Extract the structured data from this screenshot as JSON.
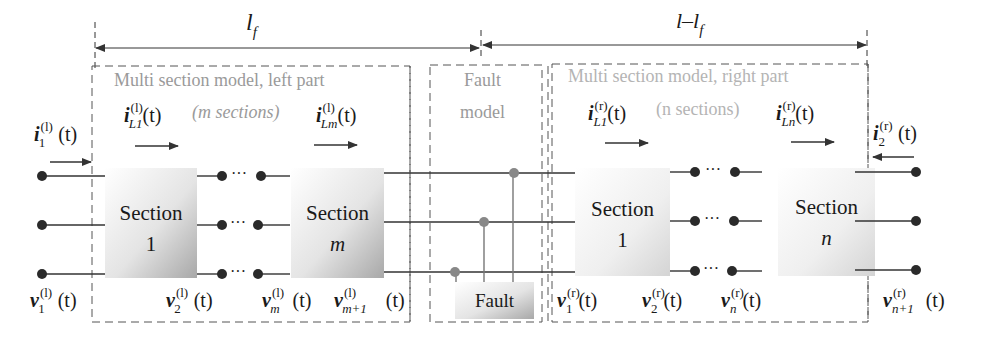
{
  "dimensions": {
    "left_label": "l",
    "left_label_sub": "f",
    "right_label": "l–l",
    "right_label_sub": "f"
  },
  "left_part": {
    "title": "Multi section model, left part",
    "count_label": "(m sections)",
    "sections": [
      {
        "label": "Section",
        "index": "1"
      },
      {
        "label": "Section",
        "index": "m"
      }
    ],
    "currents": [
      {
        "name": "i",
        "sup": "(l)",
        "sub": "1",
        "arg": "(t)"
      },
      {
        "name": "i",
        "sup": "(l)",
        "sub": "L1",
        "arg": "(t)"
      },
      {
        "name": "i",
        "sup": "(l)",
        "sub": "Lm",
        "arg": "(t)"
      }
    ],
    "voltages": [
      {
        "name": "v",
        "sup": "(l)",
        "sub": "1",
        "arg": "(t)"
      },
      {
        "name": "v",
        "sup": "(l)",
        "sub": "2",
        "arg": "(t)"
      },
      {
        "name": "v",
        "sup": "(l)",
        "sub": "m",
        "arg": "(t)"
      },
      {
        "name": "v",
        "sup": "(l)",
        "sub": "m+1",
        "arg": "(t)"
      }
    ]
  },
  "fault_model": {
    "title_line1": "Fault",
    "title_line2": "model",
    "block_label": "Fault"
  },
  "right_part": {
    "title": "Multi section model, right part",
    "count_label": "(n sections)",
    "sections": [
      {
        "label": "Section",
        "index": "1"
      },
      {
        "label": "Section",
        "index": "n"
      }
    ],
    "currents": [
      {
        "name": "i",
        "sup": "(r)",
        "sub": "L1",
        "arg": "(t)"
      },
      {
        "name": "i",
        "sup": "(r)",
        "sub": "Ln",
        "arg": "(t)"
      },
      {
        "name": "i",
        "sup": "(r)",
        "sub": "2",
        "arg": "(t)"
      }
    ],
    "voltages": [
      {
        "name": "v",
        "sup": "(r)",
        "sub": "1",
        "arg": "(t)"
      },
      {
        "name": "v",
        "sup": "(r)",
        "sub": "2",
        "arg": "(t)"
      },
      {
        "name": "v",
        "sup": "(r)",
        "sub": "n",
        "arg": "(t)"
      },
      {
        "name": "v",
        "sup": "(r)",
        "sub": "n+1",
        "arg": "(t)"
      }
    ]
  },
  "ellipsis": "···",
  "colors": {
    "line": "#333333",
    "dashed": "#555555",
    "gray_text": "#9a9a9a",
    "fault_node": "#888888"
  }
}
